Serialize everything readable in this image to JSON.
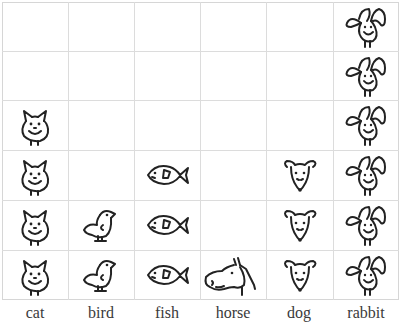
{
  "chart_data": {
    "type": "pictograph",
    "title": "",
    "xlabel": "",
    "ylabel": "",
    "categories": [
      "cat",
      "bird",
      "fish",
      "horse",
      "dog",
      "rabbit"
    ],
    "values": [
      4,
      2,
      3,
      1,
      3,
      6
    ],
    "icons": [
      "cat-icon",
      "bird-icon",
      "fish-icon",
      "horse-icon",
      "dog-icon",
      "rabbit-icon"
    ],
    "grid": true,
    "rows": 6,
    "ylim": [
      0,
      6
    ]
  },
  "labels": {
    "cat": "cat",
    "bird": "bird",
    "fish": "fish",
    "horse": "horse",
    "dog": "dog",
    "rabbit": "rabbit"
  },
  "colors": {
    "grid": "#dcdcdc",
    "ink": "#222222",
    "label": "#3a3a3a",
    "background": "#ffffff"
  }
}
